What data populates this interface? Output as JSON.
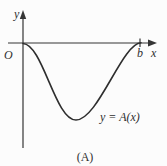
{
  "figure": {
    "y_axis_label": "y",
    "x_axis_label": "x",
    "origin_label": "O",
    "b_tick_label": "b",
    "curve_label": "y = A(x)",
    "caption": "(A)"
  },
  "colors": {
    "background": "#fcfcfc",
    "line": "#353535",
    "curve": "#2e2e2e",
    "text": "#2f2f2f"
  },
  "curve": {
    "type": "line",
    "description_points_px": [
      {
        "x": 23,
        "y": 43.5
      },
      {
        "x": 40,
        "y": 58
      },
      {
        "x": 56,
        "y": 95
      },
      {
        "x": 76,
        "y": 120
      },
      {
        "x": 100,
        "y": 108
      },
      {
        "x": 122,
        "y": 62
      },
      {
        "x": 141,
        "y": 42.5
      }
    ]
  }
}
